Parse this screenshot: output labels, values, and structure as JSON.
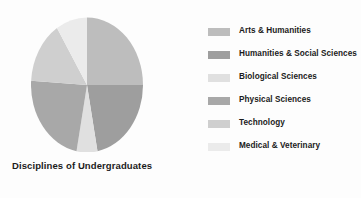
{
  "chart_data": {
    "type": "pie",
    "title": "Disciplines of Undergraduates",
    "categories": [
      "Arts & Humanities",
      "Humanities & Social Sciences",
      "Biological Sciences",
      "Physical Sciences",
      "Technology",
      "Medical & Veterinary"
    ],
    "values": [
      25,
      22,
      6,
      23,
      15,
      9
    ],
    "units": "percent",
    "colors": [
      "#bdbdbd",
      "#9e9e9e",
      "#e0e0e0",
      "#a8a8a8",
      "#cfcfcf",
      "#ebebeb"
    ],
    "start_angle": 0,
    "direction": "clockwise",
    "legend_position": "right",
    "grid": false,
    "xlabel": "",
    "ylabel": ""
  },
  "figure": {
    "background": "#fdfdfd",
    "title_color": "#1b1b1b"
  },
  "legend": {
    "items": [
      {
        "label": "Arts & Humanities",
        "color": "#bdbdbd"
      },
      {
        "label": "Humanities & Social Sciences",
        "color": "#9e9e9e"
      },
      {
        "label": "Biological Sciences",
        "color": "#e0e0e0"
      },
      {
        "label": "Physical Sciences",
        "color": "#a8a8a8"
      },
      {
        "label": "Technology",
        "color": "#cfcfcf"
      },
      {
        "label": "Medical & Veterinary",
        "color": "#ebebeb"
      }
    ]
  }
}
